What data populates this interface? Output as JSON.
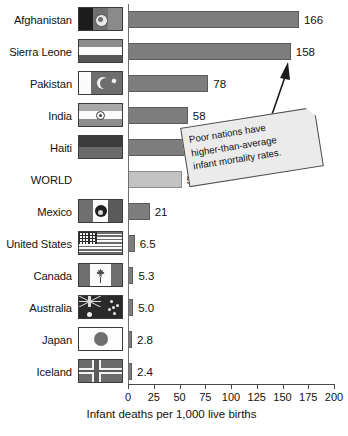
{
  "chart_data": {
    "type": "bar",
    "orientation": "horizontal",
    "title": "",
    "xlabel": "Infant deaths per 1,000 live births",
    "ylabel": "",
    "xlim": [
      0,
      200
    ],
    "xticks": [
      0,
      25,
      50,
      75,
      100,
      125,
      150,
      175,
      200
    ],
    "xtick_labels": [
      "0",
      "25",
      "50",
      "75",
      "100",
      "125",
      "150",
      "175",
      "200"
    ],
    "grid": false,
    "legend": null,
    "categories": [
      "Afghanistan",
      "Sierra Leone",
      "Pakistan",
      "India",
      "Haiti",
      "WORLD",
      "Mexico",
      "United States",
      "Canada",
      "Australia",
      "Japan",
      "Iceland"
    ],
    "values": [
      166,
      158,
      78,
      58,
      57,
      52,
      21,
      6.5,
      5.3,
      5.0,
      2.8,
      2.4
    ],
    "value_labels": [
      "166",
      "158",
      "78",
      "58",
      "57",
      "52",
      "21",
      "6.5",
      "5.3",
      "5.0",
      "2.8",
      "2.4"
    ],
    "highlight_category": "WORLD",
    "annotations": [
      {
        "text": "Poor nations have higher-than-average infant mortality rates.",
        "lines": [
          "Poor nations have",
          "higher-than-average",
          "infant mortality rates."
        ],
        "points_to": "Pakistan"
      }
    ],
    "colors": {
      "bar": "#7d7d7d",
      "bar_highlight": "#c2c2c2",
      "axis": "#4a4a4a",
      "text": "#111111",
      "note_background": "#ebebeb"
    }
  },
  "rows": [
    {
      "label": "Afghanistan",
      "value_label": "166",
      "flag": "flag-afghanistan"
    },
    {
      "label": "Sierra Leone",
      "value_label": "158",
      "flag": "flag-sierra-leone"
    },
    {
      "label": "Pakistan",
      "value_label": "78",
      "flag": "flag-pakistan"
    },
    {
      "label": "India",
      "value_label": "58",
      "flag": "flag-india"
    },
    {
      "label": "Haiti",
      "value_label": "57",
      "flag": "flag-haiti"
    },
    {
      "label": "WORLD",
      "value_label": "52",
      "flag": "flag-none"
    },
    {
      "label": "Mexico",
      "value_label": "21",
      "flag": "flag-mexico"
    },
    {
      "label": "United States",
      "value_label": "6.5",
      "flag": "flag-united-states"
    },
    {
      "label": "Canada",
      "value_label": "5.3",
      "flag": "flag-canada"
    },
    {
      "label": "Australia",
      "value_label": "5.0",
      "flag": "flag-australia"
    },
    {
      "label": "Japan",
      "value_label": "2.8",
      "flag": "flag-japan"
    },
    {
      "label": "Iceland",
      "value_label": "2.4",
      "flag": "flag-iceland"
    }
  ],
  "axis": {
    "title": "Infant deaths per 1,000 live births",
    "ticks": [
      "0",
      "25",
      "50",
      "75",
      "100",
      "125",
      "150",
      "175",
      "200"
    ]
  },
  "callout": {
    "line1": "Poor nations have",
    "line2": "higher-than-average",
    "line3": "infant mortality rates."
  }
}
